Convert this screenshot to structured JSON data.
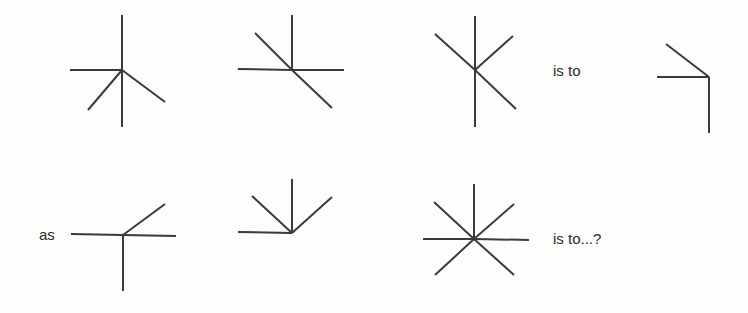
{
  "puzzle": {
    "labels": {
      "is_to_1": "is to",
      "as": "as",
      "is_to_2": "is to...?"
    },
    "stroke_color": "#3a3a3a",
    "figures": [
      {
        "name": "figure-1",
        "center": [
          122,
          70
        ],
        "arms": [
          [
            122,
            15
          ],
          [
            122,
            127
          ],
          [
            70,
            70
          ],
          [
            88,
            110
          ],
          [
            165,
            102
          ]
        ]
      },
      {
        "name": "figure-2",
        "center": [
          292,
          70
        ],
        "arms": [
          [
            292,
            15
          ],
          [
            238,
            69
          ],
          [
            344,
            70
          ],
          [
            255,
            33
          ],
          [
            332,
            108
          ]
        ]
      },
      {
        "name": "figure-3",
        "center": [
          475,
          70
        ],
        "arms": [
          [
            475,
            16
          ],
          [
            475,
            127
          ],
          [
            435,
            34
          ],
          [
            513,
            36
          ],
          [
            516,
            109
          ]
        ]
      },
      {
        "name": "figure-4",
        "center": [
          709,
          77
        ],
        "arms": [
          [
            709,
            133
          ],
          [
            657,
            77
          ],
          [
            666,
            44
          ]
        ]
      },
      {
        "name": "figure-5",
        "center": [
          123,
          235
        ],
        "arms": [
          [
            123,
            291
          ],
          [
            71,
            234
          ],
          [
            176,
            236
          ],
          [
            165,
            204
          ]
        ]
      },
      {
        "name": "figure-6",
        "center": [
          292,
          233
        ],
        "arms": [
          [
            292,
            179
          ],
          [
            238,
            232
          ],
          [
            252,
            196
          ],
          [
            332,
            197
          ]
        ]
      },
      {
        "name": "figure-7",
        "center": [
          474,
          239
        ],
        "arms": [
          [
            474,
            184
          ],
          [
            423,
            239
          ],
          [
            529,
            240
          ],
          [
            434,
            202
          ],
          [
            514,
            204
          ],
          [
            435,
            275
          ],
          [
            514,
            275
          ]
        ]
      }
    ]
  }
}
